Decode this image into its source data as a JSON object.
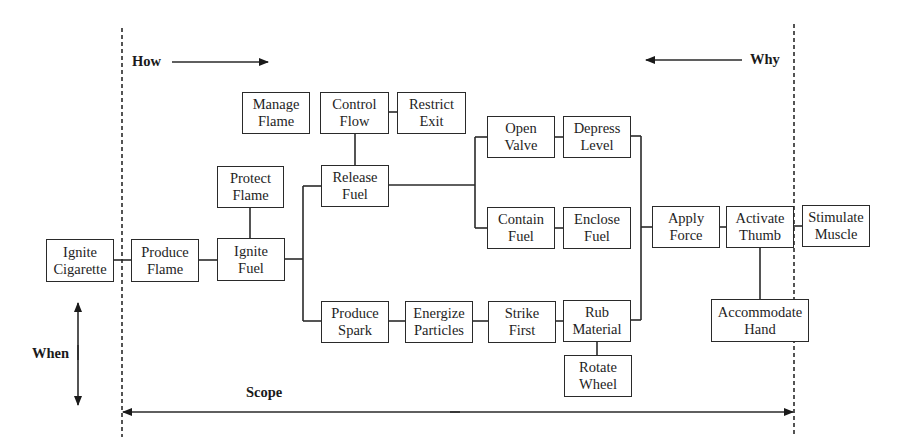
{
  "diagram": {
    "type": "FAST diagram",
    "axis_labels": {
      "how": "How",
      "why": "Why",
      "when": "When",
      "scope": "Scope"
    },
    "colors": {
      "line": "#2a2a2a",
      "background": "#ffffff",
      "text": "#1e1e1e"
    },
    "nodes": {
      "ignite_cigarette": {
        "line1": "Ignite",
        "line2": "Cigarette"
      },
      "produce_flame": {
        "line1": "Produce",
        "line2": "Flame"
      },
      "ignite_fuel": {
        "line1": "Ignite",
        "line2": "Fuel"
      },
      "protect_flame": {
        "line1": "Protect",
        "line2": "Flame"
      },
      "manage_flame": {
        "line1": "Manage",
        "line2": "Flame"
      },
      "control_flow": {
        "line1": "Control",
        "line2": "Flow"
      },
      "restrict_exit": {
        "line1": "Restrict",
        "line2": "Exit"
      },
      "release_fuel": {
        "line1": "Release",
        "line2": "Fuel"
      },
      "open_valve": {
        "line1": "Open",
        "line2": "Valve"
      },
      "depress_level": {
        "line1": "Depress",
        "line2": "Level"
      },
      "contain_fuel": {
        "line1": "Contain",
        "line2": "Fuel"
      },
      "enclose_fuel": {
        "line1": "Enclose",
        "line2": "Fuel"
      },
      "produce_spark": {
        "line1": "Produce",
        "line2": "Spark"
      },
      "energize_particles": {
        "line1": "Energize",
        "line2": "Particles"
      },
      "strike_first": {
        "line1": "Strike",
        "line2": "First"
      },
      "rub_material": {
        "line1": "Rub",
        "line2": "Material"
      },
      "rotate_wheel": {
        "line1": "Rotate",
        "line2": "Wheel"
      },
      "apply_force": {
        "line1": "Apply",
        "line2": "Force"
      },
      "activate_thumb": {
        "line1": "Activate",
        "line2": "Thumb"
      },
      "stimulate_muscle": {
        "line1": "Stimulate",
        "line2": "Muscle"
      },
      "accommodate_hand": {
        "line1": "Accommodate",
        "line2": "Hand"
      }
    }
  }
}
